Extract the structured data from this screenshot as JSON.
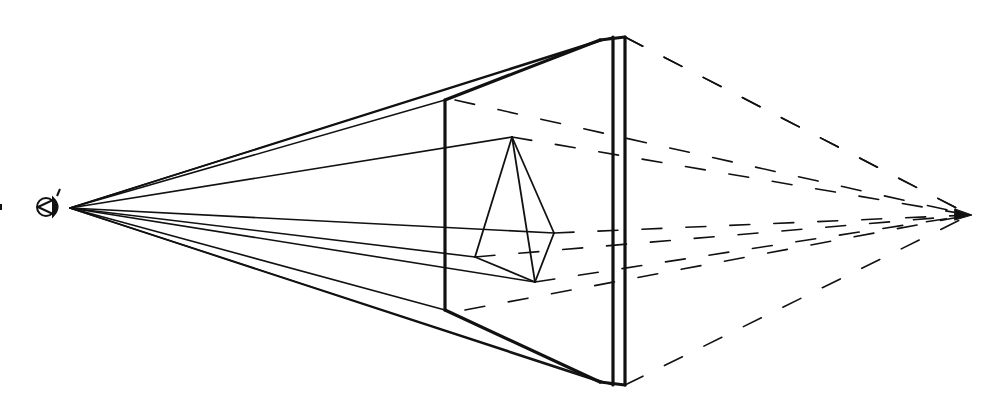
{
  "diagram": {
    "colors": {
      "stroke": "#111111",
      "background": "#ffffff"
    },
    "eye": {
      "icon": "eye-icon",
      "x": 48,
      "y": 207
    },
    "station_point": {
      "x": 70,
      "y": 208
    },
    "vanishing_point": {
      "x": 970,
      "y": 215
    },
    "frame": {
      "x1": 613,
      "x2": 625,
      "top": 37,
      "bottom": 385
    },
    "picture_plane": {
      "x": 445,
      "top": 100,
      "bottom": 310
    },
    "pyramid": {
      "apex": [
        512,
        137
      ],
      "right": [
        554,
        233
      ],
      "left": [
        475,
        257
      ],
      "bottom": [
        535,
        282
      ]
    }
  }
}
